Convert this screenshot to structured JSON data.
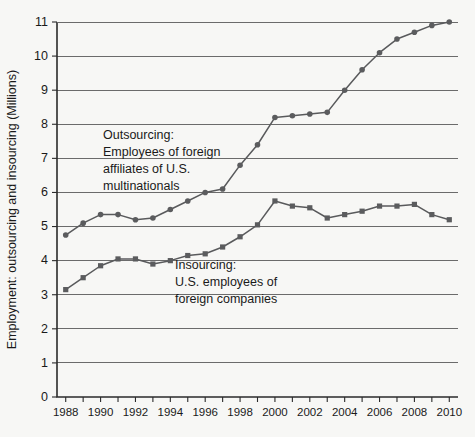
{
  "chart_data": {
    "type": "line",
    "title": "",
    "xlabel": "",
    "ylabel": "Employment: outsourcing and insourcing (Millions)",
    "xlim": [
      1987.5,
      2010.5
    ],
    "ylim": [
      0,
      11
    ],
    "y_ticks": [
      0,
      1,
      2,
      3,
      4,
      5,
      6,
      7,
      8,
      9,
      10,
      11
    ],
    "x_ticks": [
      1988,
      1989,
      1990,
      1991,
      1992,
      1993,
      1994,
      1995,
      1996,
      1997,
      1998,
      1999,
      2000,
      2001,
      2002,
      2003,
      2004,
      2005,
      2006,
      2007,
      2008,
      2009,
      2010
    ],
    "x_tick_labels": [
      "1988",
      "",
      "1990",
      "",
      "1992",
      "",
      "1994",
      "",
      "1996",
      "",
      "1998",
      "",
      "2000",
      "",
      "2002",
      "",
      "2004",
      "",
      "2006",
      "",
      "2008",
      "",
      "2010"
    ],
    "grid": "horizontal",
    "legend_position": "inline-annotations",
    "x": [
      1988,
      1989,
      1990,
      1991,
      1992,
      1993,
      1994,
      1995,
      1996,
      1997,
      1998,
      1999,
      2000,
      2001,
      2002,
      2003,
      2004,
      2005,
      2006,
      2007,
      2008,
      2009,
      2010
    ],
    "series": [
      {
        "name": "Outsourcing: Employees of foreign affiliates of U.S. multinationals",
        "marker": "circle",
        "color": "#5b5c5e",
        "values": [
          4.75,
          5.1,
          5.35,
          5.35,
          5.2,
          5.25,
          5.5,
          5.75,
          6.0,
          6.1,
          6.8,
          7.4,
          8.2,
          8.25,
          8.3,
          8.35,
          9.0,
          9.6,
          10.1,
          10.5,
          10.7,
          10.9,
          11.0
        ]
      },
      {
        "name": "Insourcing: U.S. employees of foreign companies",
        "marker": "square",
        "color": "#5b5c5e",
        "values": [
          3.15,
          3.5,
          3.85,
          4.05,
          4.05,
          3.9,
          4.0,
          4.15,
          4.2,
          4.4,
          4.7,
          5.05,
          5.75,
          5.6,
          5.55,
          5.25,
          5.35,
          5.45,
          5.6,
          5.6,
          5.65,
          5.35,
          5.2
        ]
      }
    ],
    "annotations": [
      {
        "id": "outsourcing-label",
        "lines": [
          "Outsourcing:",
          "Employees of foreign",
          "affiliates of U.S.",
          "multinationals"
        ],
        "x": 103,
        "y": 139
      },
      {
        "id": "insourcing-label",
        "lines": [
          "Insourcing:",
          "U.S. employees of",
          "foreign companies"
        ],
        "x": 175,
        "y": 269
      }
    ]
  }
}
